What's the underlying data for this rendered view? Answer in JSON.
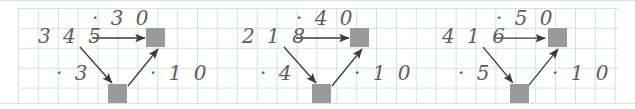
{
  "canvas": {
    "width": 635,
    "height": 109,
    "background": "#ffffff",
    "grid_line_color": "#d9dde6",
    "ink_color": "#5d5d5d",
    "arrow_color": "#3a3a3a",
    "box_color": "#9a9a9a",
    "grid_cell_px": 20
  },
  "panels": [
    {
      "name": "panel-1",
      "operand": "3 4 5",
      "top_label": "· 3 0",
      "left_label": "· 3",
      "right_label": "· 1 0",
      "top_box": "",
      "bottom_box": "",
      "arrows": [
        "horizontal-right",
        "diagonal-down-right",
        "diagonal-up-right"
      ]
    },
    {
      "name": "panel-2",
      "operand": "2 1 8",
      "top_label": "· 4 0",
      "left_label": "· 4",
      "right_label": "· 1 0",
      "top_box": "",
      "bottom_box": "",
      "arrows": [
        "horizontal-right",
        "diagonal-down-right",
        "diagonal-up-right"
      ]
    },
    {
      "name": "panel-3",
      "operand": "4 1 6",
      "top_label": "· 5 0",
      "left_label": "· 5",
      "right_label": "· 1 0",
      "top_box": "",
      "bottom_box": "",
      "arrows": [
        "horizontal-right",
        "diagonal-down-right",
        "diagonal-up-right"
      ]
    }
  ]
}
